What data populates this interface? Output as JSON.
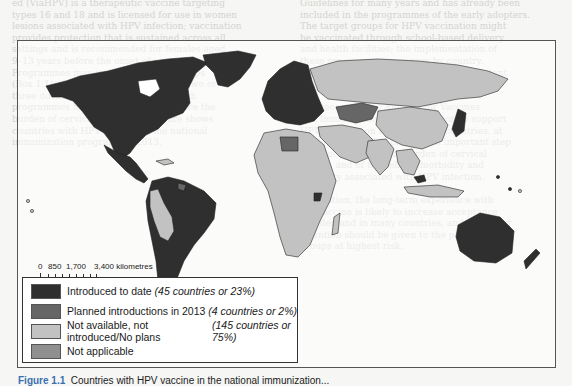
{
  "figure": {
    "caption_label": "Figure 1.1",
    "caption_text": "Countries with HPV vaccine in the national immunization..."
  },
  "legend": {
    "items": [
      {
        "label": "Introduced to date",
        "detail": "(45 countries or 23%)",
        "color": "#2f2f2f"
      },
      {
        "label": "Planned introductions in 2013",
        "detail": "(4 countries or 2%)",
        "color": "#666666"
      },
      {
        "label": "Not available, not introduced/No plans",
        "detail": "(145 countries or 75%)",
        "color": "#c2c2c2"
      },
      {
        "label": "Not applicable",
        "detail": "",
        "color": "#8f8f8f"
      }
    ]
  },
  "scale_bar": {
    "ticks": [
      "0",
      "850",
      "1,700",
      "3,400 kilometres"
    ]
  },
  "colors": {
    "introduced": "#2f2f2f",
    "planned": "#666666",
    "not_introduced": "#c2c2c2",
    "not_applicable": "#8f8f8f",
    "water": "#ffffff",
    "border": "#222222"
  }
}
